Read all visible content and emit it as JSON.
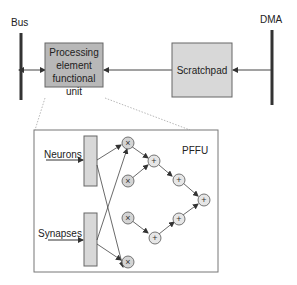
{
  "diagram": {
    "bus_label": "Bus",
    "dma_label": "DMA",
    "pefu": {
      "line1": "Processing",
      "line2": "element",
      "line3": "functional unit",
      "fill": "#b8b8b8"
    },
    "scratchpad": {
      "label": "Scratchpad",
      "fill": "#d8d8d8"
    },
    "detail": {
      "title": "PFFU",
      "inputs": [
        "Neurons",
        "Synapses"
      ],
      "multiply_nodes": 4,
      "add_nodes": 5,
      "multiply_symbol": "×",
      "add_symbol": "+"
    }
  }
}
